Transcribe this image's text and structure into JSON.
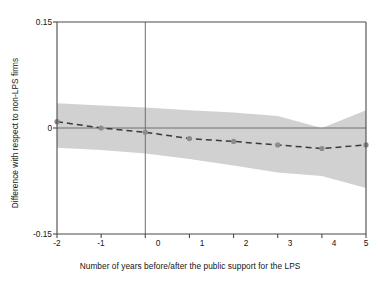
{
  "chart_data": {
    "type": "line",
    "title": "",
    "subtitle": "",
    "xlabel": "Number of years before/after the public support for the LPS",
    "ylabel": "Difference with respect to non-LPS firms",
    "x": [
      -2,
      -1,
      0,
      1,
      2,
      3,
      4,
      5
    ],
    "xticklabels": [
      "-2",
      "-1",
      "0",
      "1",
      "2",
      "3",
      "4",
      "5"
    ],
    "yticks": [
      -0.15,
      0,
      0.15
    ],
    "yticklabels": [
      "-0.15",
      "0",
      "0.15"
    ],
    "xlim": [
      -2,
      5
    ],
    "ylim": [
      -0.15,
      0.15
    ],
    "grid": false,
    "legend": null,
    "series": [
      {
        "name": "Point estimate",
        "style": "dashed-with-markers",
        "color": "#3a3a3a",
        "marker_color": "#8c8c8c",
        "values": [
          0.009,
          0.0,
          -0.006,
          -0.015,
          -0.019,
          -0.024,
          -0.029,
          -0.024
        ]
      },
      {
        "name": "Confidence interval upper",
        "style": "band-edge",
        "color": "#c9c9c9",
        "values": [
          0.035,
          0.032,
          0.029,
          0.025,
          0.022,
          0.017,
          0.0,
          0.025
        ]
      },
      {
        "name": "Confidence interval lower",
        "style": "band-edge",
        "color": "#c9c9c9",
        "values": [
          -0.028,
          -0.031,
          -0.036,
          -0.044,
          -0.053,
          -0.063,
          -0.068,
          -0.085
        ]
      }
    ],
    "reference_lines": [
      {
        "name": "zero-horizontal-line",
        "orientation": "horizontal",
        "value": 0,
        "color": "#6e6e6e"
      },
      {
        "name": "event-time-vertical-line",
        "orientation": "vertical",
        "value": 0,
        "color": "#6e6e6e"
      }
    ],
    "band_fill_color": "#cfcfcf",
    "axis_color": "#4a4a4a",
    "background_color": "#ffffff"
  },
  "axes": {
    "x_title": "Number of years before/after the public support for the LPS",
    "y_title": "Difference with respect to non-LPS firms",
    "x_ticks": [
      {
        "label": "-2",
        "value": -2
      },
      {
        "label": "-1",
        "value": -1
      },
      {
        "label": "0",
        "value": 0
      },
      {
        "label": "1",
        "value": 1
      },
      {
        "label": "2",
        "value": 2
      },
      {
        "label": "3",
        "value": 3
      },
      {
        "label": "4",
        "value": 4
      },
      {
        "label": "5",
        "value": 5
      }
    ],
    "y_ticks": [
      {
        "label": "0.15",
        "value": 0.15
      },
      {
        "label": "0",
        "value": 0
      },
      {
        "label": "-0.15",
        "value": -0.15
      }
    ]
  }
}
